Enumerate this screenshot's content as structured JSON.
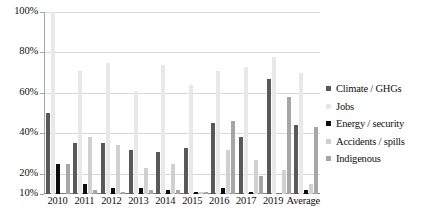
{
  "chart_data": {
    "type": "bar",
    "title": "",
    "xlabel": "",
    "ylabel": "",
    "ylim": [
      10,
      100
    ],
    "yticks": [
      10,
      20,
      40,
      60,
      80,
      100
    ],
    "ytick_labels": [
      "10%",
      "20%",
      "40%",
      "60%",
      "80%",
      "100%"
    ],
    "grid": true,
    "legend_position": "right",
    "categories": [
      "2010",
      "2011",
      "2012",
      "2013",
      "2014",
      "2015",
      "2016",
      "2017",
      "2019",
      "Average"
    ],
    "series": [
      {
        "name": "Climate / GHGs",
        "color": "#595959",
        "values": [
          50,
          35,
          35,
          32,
          31,
          33,
          45,
          38,
          67,
          44
        ]
      },
      {
        "name": "Jobs",
        "color": "#e8e8e8",
        "values": [
          100,
          71,
          75,
          61,
          74,
          64,
          71,
          73,
          78,
          70
        ]
      },
      {
        "name": "Energy / security",
        "color": "#0d0d0d",
        "values": [
          25,
          15,
          13,
          13,
          12,
          11,
          13,
          11,
          10,
          12
        ]
      },
      {
        "name": "Accidents / spills",
        "color": "#d0d0d0",
        "values": [
          10,
          38,
          34,
          23,
          25,
          11,
          32,
          27,
          22,
          15
        ]
      },
      {
        "name": "Indigenous",
        "color": "#a6a6a6",
        "values": [
          25,
          12,
          11,
          12,
          12,
          11,
          46,
          19,
          58,
          43
        ]
      }
    ]
  }
}
